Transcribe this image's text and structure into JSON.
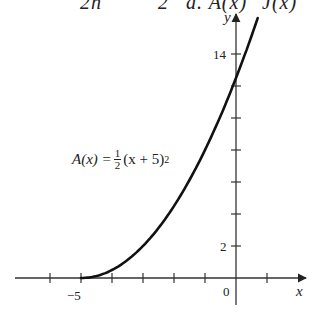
{
  "top_fragment": {
    "parts": [
      "2h",
      "2",
      "a. A(x)",
      "J(x)"
    ]
  },
  "chart_data": {
    "type": "line",
    "title": "",
    "function_label": {
      "lhs": "A(x) =",
      "frac_num": "1",
      "frac_den": "2",
      "rhs": "(x + 5)",
      "exponent": "2"
    },
    "xlabel": "x",
    "ylabel": "y",
    "x_tick_labels": [
      {
        "value": -5,
        "label": "−5"
      },
      {
        "value": 0,
        "label": "0"
      }
    ],
    "y_tick_labels": [
      {
        "value": 2,
        "label": "2"
      },
      {
        "value": 14,
        "label": "14"
      }
    ],
    "x_ticks": [
      -6,
      -5,
      -4,
      -3,
      -2,
      -1,
      0,
      1
    ],
    "y_ticks": [
      2,
      4,
      6,
      8,
      10,
      12,
      14
    ],
    "xlim": [
      -6.9,
      2.2
    ],
    "ylim": [
      -1.5,
      16.5
    ],
    "series": [
      {
        "name": "A(x) = 1/2 (x + 5)^2",
        "x": [
          -5,
          -4.5,
          -4,
          -3.5,
          -3,
          -2.5,
          -2,
          -1.5,
          -1,
          -0.5,
          0,
          0.5,
          0.7
        ],
        "y": [
          0,
          0.125,
          0.5,
          1.125,
          2,
          3.125,
          4.5,
          6.125,
          8,
          10.125,
          12.5,
          15.125,
          16.245
        ]
      }
    ],
    "grid": false,
    "legend": "none"
  },
  "axes": {
    "x_label": "x",
    "y_label": "y",
    "label_minus5": "−5",
    "label_0": "0",
    "label_2": "2",
    "label_14": "14"
  }
}
